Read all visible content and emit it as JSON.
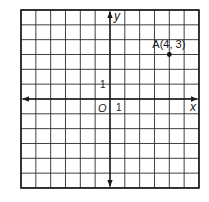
{
  "diagram": {
    "type": "coordinate-plane",
    "grid": {
      "cells_x": 12,
      "cells_y": 12,
      "x_range": [
        -6,
        6
      ],
      "y_range": [
        -6,
        6
      ],
      "left_px": 21,
      "top_px": 10,
      "cell_px": 14.83,
      "line_color": "#2a2a2a",
      "border_color": "#1a1a1a"
    },
    "axes": {
      "x_label": "x",
      "y_label": "y",
      "origin_label": "O",
      "x_tick_label": "1",
      "y_tick_label": "1"
    },
    "points": [
      {
        "name": "A",
        "x": 4,
        "y": 3,
        "label": "A(4, 3)",
        "color": "#111111"
      }
    ]
  }
}
